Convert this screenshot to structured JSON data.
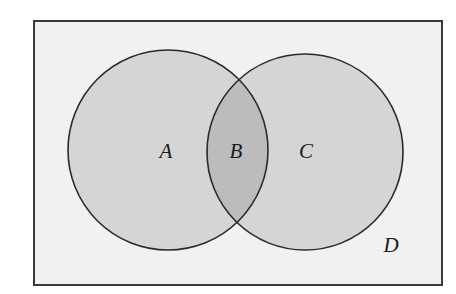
{
  "figure": {
    "name": "venn-diagram-two-sets",
    "background_color": "#ffffff"
  },
  "universe": {
    "label": "D",
    "role": "universal-set-rectangle",
    "fill_color": "#f1f1f1",
    "stroke_color": "#3a3a3a",
    "stroke_width": 2,
    "x": 34,
    "y": 21,
    "width": 408,
    "height": 264,
    "label_x": 391,
    "label_y": 247
  },
  "sets": [
    {
      "key": "left",
      "label": "A",
      "role": "left-circle-region",
      "fill_color": "#d5d5d5",
      "stroke_color": "#2b2b2b",
      "stroke_width": 1.6,
      "cx": 168,
      "cy": 150,
      "r": 100,
      "label_x": 166,
      "label_y": 153
    },
    {
      "key": "right",
      "label": "C",
      "role": "right-circle-region",
      "fill_color": "#d5d5d5",
      "stroke_color": "#2b2b2b",
      "stroke_width": 1.6,
      "cx": 305,
      "cy": 152,
      "r": 98,
      "label_x": 306,
      "label_y": 153
    }
  ],
  "intersection": {
    "label": "B",
    "role": "intersection-lens-region",
    "fill_color": "#bcbcbc",
    "label_x": 236,
    "label_y": 153,
    "upper_point_x": 238,
    "upper_point_y": 80,
    "lower_point_x": 236,
    "lower_point_y": 223
  },
  "chart_data": {
    "type": "venn",
    "title": "",
    "regions": [
      {
        "id": "A",
        "description": "left circle only",
        "shade": "light-gray"
      },
      {
        "id": "B",
        "description": "intersection of left and right circles",
        "shade": "medium-gray"
      },
      {
        "id": "C",
        "description": "right circle only",
        "shade": "light-gray"
      },
      {
        "id": "D",
        "description": "universal set rectangle outside both circles",
        "shade": "near-white"
      }
    ],
    "labels": [
      "A",
      "B",
      "C",
      "D"
    ]
  }
}
